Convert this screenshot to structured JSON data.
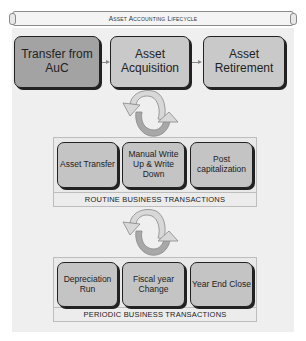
{
  "title": "Asset Accounting Lifecycle",
  "top_row": [
    {
      "label": "Transfer from AuC"
    },
    {
      "label": "Asset Acquisition"
    },
    {
      "label": "Asset Retirement"
    }
  ],
  "routine": {
    "items": [
      {
        "label": "Asset Transfer"
      },
      {
        "label": "Manual Write Up & Write Down"
      },
      {
        "label": "Post capitalization"
      }
    ],
    "label": "ROUTINE BUSINESS TRANSACTIONS"
  },
  "periodic": {
    "items": [
      {
        "label": "Depreciation Run"
      },
      {
        "label": "Fiscal year Change"
      },
      {
        "label": "Year End Close"
      }
    ],
    "label": "PERIODIC BUSINESS TRANSACTIONS"
  },
  "colors": {
    "dark_box": "#a3a3a3",
    "light_box": "#c9c9c9",
    "panel": "#efefef",
    "arrow_light": "#d8d8d8",
    "arrow_dark": "#a8a8a8"
  }
}
